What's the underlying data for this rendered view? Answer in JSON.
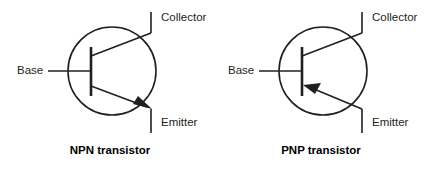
{
  "figure": {
    "background_color": "#ffffff",
    "line_color": "#231f20",
    "text_color": "#231f20"
  },
  "symbols": [
    {
      "id": "npn",
      "caption": "NPN transistor",
      "type": "npn",
      "arrow_direction": "outward-toward-emitter",
      "labels": {
        "base": "Base",
        "collector": "Collector",
        "emitter": "Emitter"
      },
      "geometry": {
        "circle_cx": 112,
        "circle_cy": 71,
        "circle_r": 44,
        "base_bar_x": 91,
        "base_bar_y1": 47,
        "base_bar_y2": 96,
        "base_lead_x1": 48,
        "base_lead_y": 71,
        "collector_lead_x": 151,
        "collector_lead_y_top": 12,
        "emitter_lead_x": 151,
        "emitter_lead_y_bottom": 133
      }
    },
    {
      "id": "pnp",
      "caption": "PNP transistor",
      "type": "pnp",
      "arrow_direction": "inward-toward-base",
      "labels": {
        "base": "Base",
        "collector": "Collector",
        "emitter": "Emitter"
      },
      "geometry": {
        "circle_cx": 323,
        "circle_cy": 71,
        "circle_r": 44,
        "base_bar_x": 302,
        "base_bar_y1": 47,
        "base_bar_y2": 96,
        "base_lead_x1": 259,
        "base_lead_y": 71,
        "collector_lead_x": 362,
        "collector_lead_y_top": 12,
        "emitter_lead_x": 362,
        "emitter_lead_y_bottom": 133
      }
    }
  ]
}
